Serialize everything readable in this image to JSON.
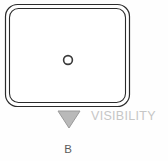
{
  "figure": {
    "caption": "B",
    "background_color": "#fefefe",
    "housing": {
      "name": "rounded-rectangle-housing",
      "outline_color": "#2b2b2b",
      "fill_color": "#ffffff",
      "outer": {
        "x": 5,
        "y": 4,
        "width": 125,
        "height": 103,
        "radius": 12
      },
      "inner": {
        "x": 9,
        "y": 8,
        "width": 117,
        "height": 95,
        "radius": 9
      }
    },
    "center_circle": {
      "name": "center-circle-marker",
      "cx": 68,
      "cy": 60,
      "r": 4.4,
      "outline_color": "#3a3a3a",
      "fill_color": "#ffffff"
    },
    "visibility_marker": {
      "name": "visibility-triangle-marker",
      "shape": "triangle-down",
      "fill_color": "#b9b9b9",
      "stroke_color": "#9a9a9a",
      "points": "58,111 80,111 69,128"
    },
    "visibility_label": {
      "text": "VISIBILITY",
      "color": "#c6c6c6"
    }
  }
}
